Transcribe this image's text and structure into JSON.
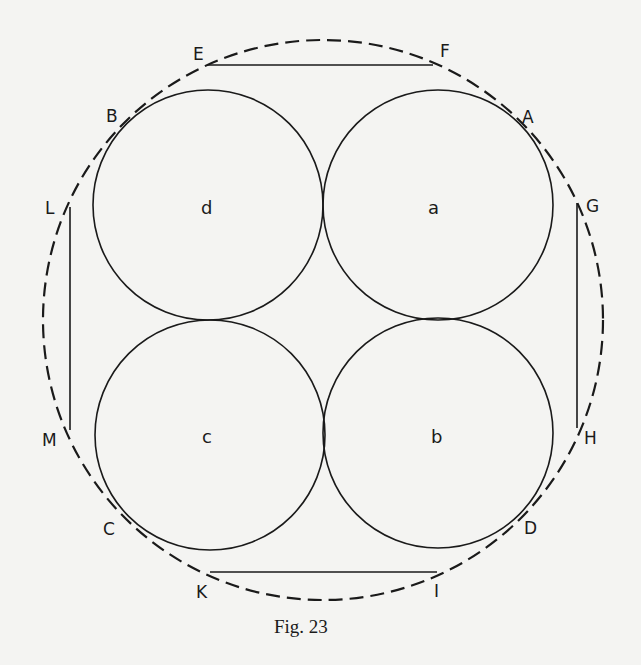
{
  "figure": {
    "caption": "Fig. 23",
    "outer_circle": {
      "cx": 323,
      "cy": 320,
      "r": 280,
      "style": "dashed"
    },
    "small_circles": [
      {
        "id": "d",
        "label": "d",
        "cx": 208,
        "cy": 205,
        "r": 115
      },
      {
        "id": "a",
        "label": "a",
        "cx": 438,
        "cy": 205,
        "r": 115
      },
      {
        "id": "c",
        "label": "c",
        "cx": 210,
        "cy": 435,
        "r": 115
      },
      {
        "id": "b",
        "label": "b",
        "cx": 438,
        "cy": 433,
        "r": 115
      }
    ],
    "segments": [
      {
        "id": "EF",
        "x1": 207,
        "y1": 65,
        "x2": 433,
        "y2": 65
      },
      {
        "id": "KI",
        "x1": 210,
        "y1": 572,
        "x2": 437,
        "y2": 572
      },
      {
        "id": "LM",
        "x1": 70,
        "y1": 207,
        "x2": 70,
        "y2": 430
      },
      {
        "id": "GH",
        "x1": 577,
        "y1": 203,
        "x2": 577,
        "y2": 428
      }
    ],
    "points": [
      {
        "label": "E",
        "x": 193,
        "y": 60
      },
      {
        "label": "F",
        "x": 440,
        "y": 57
      },
      {
        "label": "B",
        "x": 106,
        "y": 122
      },
      {
        "label": "A",
        "x": 522,
        "y": 123
      },
      {
        "label": "L",
        "x": 45,
        "y": 214
      },
      {
        "label": "G",
        "x": 586,
        "y": 212
      },
      {
        "label": "M",
        "x": 42,
        "y": 446
      },
      {
        "label": "H",
        "x": 584,
        "y": 444
      },
      {
        "label": "C",
        "x": 103,
        "y": 535
      },
      {
        "label": "D",
        "x": 524,
        "y": 534
      },
      {
        "label": "K",
        "x": 196,
        "y": 598
      },
      {
        "label": "I",
        "x": 434,
        "y": 597
      }
    ],
    "circle_labels": [
      {
        "label": "d",
        "x": 201,
        "y": 214
      },
      {
        "label": "a",
        "x": 428,
        "y": 214
      },
      {
        "label": "c",
        "x": 202,
        "y": 443
      },
      {
        "label": "b",
        "x": 431,
        "y": 443
      }
    ],
    "caption_pos": {
      "x": 274,
      "y": 633
    }
  }
}
